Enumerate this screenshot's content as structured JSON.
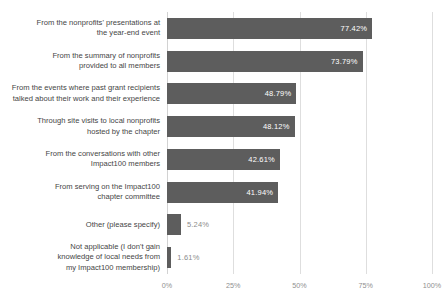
{
  "chart_data": {
    "type": "bar",
    "orientation": "horizontal",
    "title": "",
    "subtitle": "",
    "xlabel": "",
    "ylabel": "",
    "xlim": [
      0,
      100
    ],
    "grid": true,
    "legend": false,
    "value_suffix": "%",
    "xticks": [
      {
        "value": 0,
        "label": "0%"
      },
      {
        "value": 25,
        "label": "25%"
      },
      {
        "value": 50,
        "label": "50%"
      },
      {
        "value": 75,
        "label": "75%"
      },
      {
        "value": 100,
        "label": "100%"
      }
    ],
    "categories": [
      "From the nonprofits' presentations at\nthe year-end event",
      "From the summary of nonprofits\nprovided to all members",
      "From the events where past grant recipients\ntalked about their work and their experience",
      "Through site visits to local nonprofits\nhosted by the chapter",
      "From the conversations with other\nImpact100 members",
      "From serving on the Impact100\nchapter committee",
      "Other (please specify)",
      "Not applicable (I don't gain\nknowledge of local needs from\nmy Impact100 membership)"
    ],
    "values": [
      77.42,
      73.79,
      48.79,
      48.12,
      42.61,
      41.94,
      5.24,
      1.61
    ],
    "value_labels": [
      "77.42%",
      "73.79%",
      "48.79%",
      "48.12%",
      "42.61%",
      "41.94%",
      "5.24%",
      "1.61%"
    ],
    "label_placement": [
      "inside",
      "inside",
      "inside",
      "inside",
      "inside",
      "inside",
      "outside",
      "outside"
    ],
    "colors": {
      "bar": "#5d5d5d",
      "gridline": "#dedede",
      "inside_label": "#ffffff",
      "outside_label": "#8c8c8c",
      "category_label": "#454545",
      "tick_label": "#8f8f8f",
      "background": "#ffffff"
    }
  }
}
